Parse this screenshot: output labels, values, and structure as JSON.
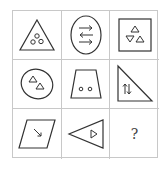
{
  "puzzle": {
    "rows": 3,
    "cols": 3,
    "stroke_color": "#333333",
    "grid_line_color": "#c8c8c8",
    "cells": [
      {
        "row": 1,
        "col": 1,
        "outer": "triangle",
        "inner": "three-circles"
      },
      {
        "row": 1,
        "col": 2,
        "outer": "ellipse",
        "inner": "three-arrows-left-right"
      },
      {
        "row": 1,
        "col": 3,
        "outer": "square",
        "inner": "three-triangles"
      },
      {
        "row": 2,
        "col": 1,
        "outer": "ellipse",
        "inner": "two-triangles"
      },
      {
        "row": 2,
        "col": 2,
        "outer": "trapezoid",
        "inner": "two-circles"
      },
      {
        "row": 2,
        "col": 3,
        "outer": "right-triangle",
        "inner": "up-down-arrows"
      },
      {
        "row": 3,
        "col": 1,
        "outer": "parallelogram",
        "inner": "one-arrow-diagonal"
      },
      {
        "row": 3,
        "col": 2,
        "outer": "triangle-pointing-left",
        "inner": "one-triangle-pointing-right"
      },
      {
        "row": 3,
        "col": 3,
        "outer": "none",
        "inner": "question-mark"
      }
    ],
    "answer_placeholder": "?"
  }
}
